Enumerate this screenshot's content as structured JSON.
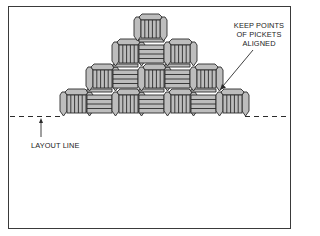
{
  "figure": {
    "type": "basket-weave picket layout diagram",
    "labels": {
      "keep_points": [
        "KEEP POINTS",
        "OF PICKETS",
        "ALIGNED"
      ],
      "layout_line": "LAYOUT LINE"
    },
    "rows": [
      {
        "row": 1,
        "cells": [
          "vertical"
        ]
      },
      {
        "row": 2,
        "cells": [
          "vertical",
          "horizontal",
          "vertical"
        ]
      },
      {
        "row": 3,
        "cells": [
          "vertical",
          "horizontal",
          "vertical",
          "horizontal",
          "vertical"
        ]
      },
      {
        "row": 4,
        "cells": [
          "vertical",
          "horizontal",
          "vertical",
          "horizontal",
          "vertical",
          "horizontal",
          "vertical"
        ]
      }
    ],
    "colors": {
      "fill": "#bdbdbd",
      "stroke": "#2b2b2b",
      "frame": "#3a3a3a",
      "text": "#222222"
    }
  }
}
